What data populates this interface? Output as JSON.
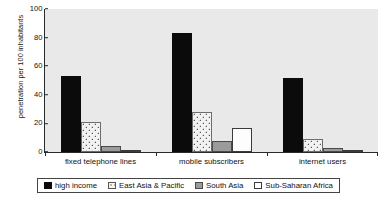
{
  "chart_data": {
    "type": "bar",
    "title": "",
    "subtitle": "",
    "xlabel": "",
    "ylabel": "penetration per 100 inhabitants",
    "ylim": [
      0,
      100
    ],
    "yticks": [
      0,
      20,
      40,
      60,
      80,
      100
    ],
    "grid": false,
    "legend_position": "bottom",
    "categories": [
      "fixed telephone lines",
      "mobile subscribers",
      "internet users"
    ],
    "series": [
      {
        "name": "high income",
        "color": "#0b0b0b",
        "pattern": "solid",
        "values": [
          53,
          83,
          52
        ]
      },
      {
        "name": "East Asia & Pacific",
        "color": "#f2f2f2",
        "pattern": "dotted",
        "values": [
          21,
          28,
          9
        ]
      },
      {
        "name": "South Asia",
        "color": "#9b9b9b",
        "pattern": "solid",
        "values": [
          4,
          8,
          3
        ]
      },
      {
        "name": "Sub-Saharan Africa",
        "color": "#ffffff",
        "pattern": "solid",
        "values": [
          1,
          17,
          1.5
        ]
      }
    ]
  },
  "axis": {
    "y_title": "penetration per 100 inhabitants",
    "y_tick_labels": [
      "100",
      "80",
      "60",
      "40",
      "20",
      "0"
    ]
  },
  "legend": {
    "items": [
      {
        "label": "high income"
      },
      {
        "label": "East Asia & Pacific"
      },
      {
        "label": "South Asia"
      },
      {
        "label": "Sub-Saharan Africa"
      }
    ]
  }
}
